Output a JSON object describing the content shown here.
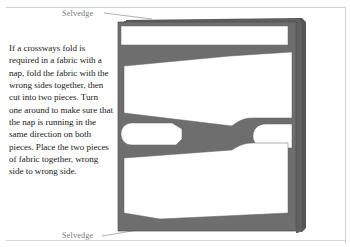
{
  "page": {
    "background_color": "#ffffff",
    "rule_color": "#cfcfcf"
  },
  "caption": {
    "text": "If a crossways fold is required in a fabric with a nap, fold the fabric with the wrong sides together, then cut into two pieces. Turn one around to make sure that the nap is running in the same direction on both pieces. Place the two pieces of fabric together, wrong side to wrong side.",
    "color": "#1b1b1b"
  },
  "labels": {
    "selvedge_top": "Selvedge",
    "selvedge_bottom": "Selvedge",
    "label_color": "#7b7b7b",
    "leader_color": "#9a9a9a"
  },
  "diagram": {
    "fabric_color": "#6e6e6e",
    "fabric_back_layer_color": "#585858",
    "fabric_edge_color": "#4a4a4a",
    "piece_color": "#ffffff",
    "piece_outline_color": "#555555",
    "pieces": [
      "top-strip-piece",
      "upper-large-piece",
      "left-small-wedge-piece",
      "right-small-wedge-piece",
      "lower-large-piece"
    ]
  }
}
